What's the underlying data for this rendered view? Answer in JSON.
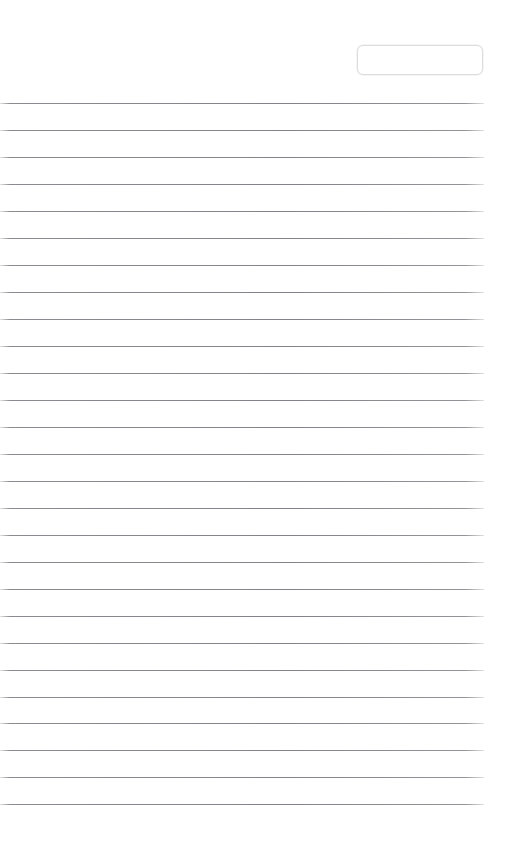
{
  "page": {
    "width": 507,
    "height": 849,
    "background_color": "#ffffff",
    "document_type": "blank-ruled-form"
  },
  "header": {
    "entry_box": {
      "name": "entry-box",
      "value": "",
      "placeholder": "",
      "border_color": "#dcdcdf",
      "background_color": "#ffffff",
      "left": 357,
      "top": 45,
      "width": 126,
      "height": 30,
      "corner_radius": 6
    }
  },
  "ruled_area": {
    "line_color": "#808086",
    "line_thickness": 1,
    "first_line_y": 103,
    "line_spacing": 27,
    "line_left": 0,
    "line_width": 484,
    "line_count": 27,
    "lines": [
      {
        "index": 1,
        "y": 103,
        "text": ""
      },
      {
        "index": 2,
        "y": 130,
        "text": ""
      },
      {
        "index": 3,
        "y": 157,
        "text": ""
      },
      {
        "index": 4,
        "y": 184,
        "text": ""
      },
      {
        "index": 5,
        "y": 211,
        "text": ""
      },
      {
        "index": 6,
        "y": 238,
        "text": ""
      },
      {
        "index": 7,
        "y": 265,
        "text": ""
      },
      {
        "index": 8,
        "y": 292,
        "text": ""
      },
      {
        "index": 9,
        "y": 319,
        "text": ""
      },
      {
        "index": 10,
        "y": 346,
        "text": ""
      },
      {
        "index": 11,
        "y": 373,
        "text": ""
      },
      {
        "index": 12,
        "y": 400,
        "text": ""
      },
      {
        "index": 13,
        "y": 427,
        "text": ""
      },
      {
        "index": 14,
        "y": 454,
        "text": ""
      },
      {
        "index": 15,
        "y": 481,
        "text": ""
      },
      {
        "index": 16,
        "y": 508,
        "text": ""
      },
      {
        "index": 17,
        "y": 535,
        "text": ""
      },
      {
        "index": 18,
        "y": 562,
        "text": ""
      },
      {
        "index": 19,
        "y": 589,
        "text": ""
      },
      {
        "index": 20,
        "y": 616,
        "text": ""
      },
      {
        "index": 21,
        "y": 643,
        "text": ""
      },
      {
        "index": 22,
        "y": 670,
        "text": ""
      },
      {
        "index": 23,
        "y": 697,
        "text": ""
      },
      {
        "index": 24,
        "y": 723,
        "text": ""
      },
      {
        "index": 25,
        "y": 750,
        "text": ""
      },
      {
        "index": 26,
        "y": 777,
        "text": ""
      },
      {
        "index": 27,
        "y": 804,
        "text": ""
      }
    ]
  },
  "footer": {
    "text": ""
  }
}
